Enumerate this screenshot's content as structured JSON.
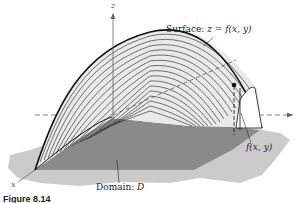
{
  "figure": {
    "caption": "Figure 8.14",
    "labels": {
      "surface_prefix": "Surface: ",
      "surface_eq": "z = f(x, y)",
      "domain_prefix": "Domain:  ",
      "domain_symbol": "D",
      "height_label": "f(x, y)",
      "z_axis": "z",
      "x_axis": "x"
    },
    "colors": {
      "background": "#ffffff",
      "shadow": "#c8c8c8",
      "domain": "#8a8a8a",
      "surface": "#e6e6e6",
      "contour": "#333333",
      "outline": "#111111"
    },
    "contour_count": 18
  }
}
